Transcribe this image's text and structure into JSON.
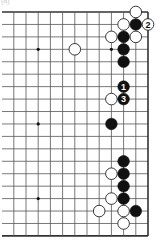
{
  "caption": "(a)",
  "board": {
    "size": 19,
    "visible_cols": [
      8,
      19
    ],
    "visible_rows": [
      1,
      19
    ],
    "edges": [
      "top",
      "right",
      "bottom"
    ],
    "origin_x": 148,
    "origin_y": 12,
    "col_spacing": 12.2,
    "row_spacing": 12.44,
    "left_extend_to": 2,
    "line_color": "#555555",
    "edge_color": "#333333",
    "star_points": [
      [
        10,
        4
      ],
      [
        16,
        4
      ],
      [
        10,
        10
      ],
      [
        16,
        10
      ],
      [
        10,
        16
      ],
      [
        16,
        16
      ]
    ]
  },
  "stones": [
    {
      "color": "white",
      "col": 18,
      "row": 1
    },
    {
      "color": "white",
      "col": 17,
      "row": 2
    },
    {
      "color": "black",
      "col": 18,
      "row": 2
    },
    {
      "color": "white",
      "col": 19,
      "row": 2,
      "label": "2"
    },
    {
      "color": "white",
      "col": 16,
      "row": 3
    },
    {
      "color": "black",
      "col": 17,
      "row": 3
    },
    {
      "color": "white",
      "col": 18,
      "row": 3
    },
    {
      "color": "white",
      "col": 13,
      "row": 4
    },
    {
      "color": "black",
      "col": 17,
      "row": 4
    },
    {
      "color": "black",
      "col": 17,
      "row": 5
    },
    {
      "color": "black",
      "col": 17,
      "row": 7,
      "label": "1"
    },
    {
      "color": "white",
      "col": 16,
      "row": 8
    },
    {
      "color": "black",
      "col": 17,
      "row": 8,
      "label": "3"
    },
    {
      "color": "black",
      "col": 16,
      "row": 10
    },
    {
      "color": "black",
      "col": 17,
      "row": 13
    },
    {
      "color": "white",
      "col": 16,
      "row": 14
    },
    {
      "color": "black",
      "col": 17,
      "row": 14
    },
    {
      "color": "black",
      "col": 17,
      "row": 15
    },
    {
      "color": "white",
      "col": 16,
      "row": 16
    },
    {
      "color": "black",
      "col": 17,
      "row": 16
    },
    {
      "color": "white",
      "col": 15,
      "row": 17
    },
    {
      "color": "white",
      "col": 17,
      "row": 17
    },
    {
      "color": "black",
      "col": 18,
      "row": 17
    },
    {
      "color": "white",
      "col": 17,
      "row": 18
    }
  ],
  "colors": {
    "black_stone": "#111111",
    "white_stone_fill": "#ffffff",
    "white_stone_stroke": "#222222",
    "label_on_black": "#ffffff",
    "label_on_white": "#111111"
  }
}
